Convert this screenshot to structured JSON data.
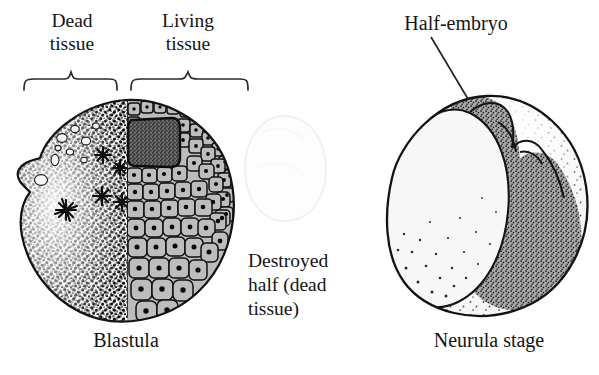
{
  "figure": {
    "width": 599,
    "height": 375,
    "background": "#ffffff",
    "ink": "#141414"
  },
  "labels": {
    "dead_tissue": "Dead\ntissue",
    "living_tissue": "Living\ntissue",
    "half_embryo": "Half-embryo",
    "destroyed_half": "Destroyed\nhalf (dead\ntissue)",
    "blastula": "Blastula",
    "neurula_stage": "Neurula stage"
  },
  "braces": {
    "dead_brace": {
      "x_start": 22,
      "x_end": 120,
      "y": 80,
      "label_ref": "dead_tissue"
    },
    "living_brace": {
      "x_start": 128,
      "x_end": 250,
      "y": 80,
      "label_ref": "living_tissue"
    }
  },
  "leaders": {
    "half_embryo_leader": {
      "x1": 431,
      "y1": 37,
      "x2": 468,
      "y2": 99
    }
  },
  "drawings": {
    "blastula": {
      "name": "blastula",
      "caption_ref": "blastula",
      "center_x": 126,
      "center_y": 212,
      "radius_x": 114,
      "radius_y": 112,
      "dead_half": {
        "side": "left",
        "fill": "#f2f2f2",
        "stipple_color": "#0d0d0d",
        "stipple_density": "high",
        "star_marks": 4,
        "vacuole_count": 9,
        "note": "stippled degenerating cytoplasm with pyknotic star-shaped nuclei"
      },
      "living_half": {
        "side": "right",
        "cell_fill": "#b9b9b9",
        "cell_outline": "#111111",
        "nucleus_color": "#0a0a0a",
        "cell_count_visible": 96,
        "note": "polygonal blastomeres with dark nuclei, smaller near animal pole"
      },
      "blastocoel": {
        "name": "blastocoel-cavity",
        "x": 127,
        "y": 117,
        "width": 50,
        "height": 50,
        "fill": "#5f5f5f"
      }
    },
    "destroyed_half_ghost": {
      "name": "destroyed-half-ghost",
      "center_x": 284,
      "center_y": 168,
      "radius_x": 42,
      "radius_y": 52,
      "fill": "#fbfbfb",
      "stroke": "#ededed",
      "note": "very faint outline of the ablated half"
    },
    "neurula": {
      "name": "neurula-half-embryo",
      "caption_ref": "neurula_stage",
      "center_x": 492,
      "center_y": 205,
      "radius_x": 100,
      "radius_y": 110,
      "body": {
        "fill": "#f4f4f4",
        "stipple_color": "#1a1a1a",
        "note": "large pale yolk mass, light stipple on lower margin"
      },
      "neural_fold": {
        "name": "neural-fold-ridge",
        "fill": "#a9a9a9",
        "stipple_color": "#161616",
        "lobe_count": 5,
        "note": "dark stippled crescent ridge along the right flank"
      }
    }
  }
}
